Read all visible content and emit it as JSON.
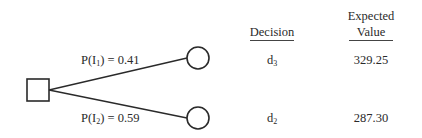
{
  "diagram": {
    "type": "decision-tree",
    "decision_node": {
      "shape": "square"
    },
    "branches": [
      {
        "label_prefix": "P(I",
        "label_sub": "1",
        "label_suffix": ") = 0.41",
        "probability": 0.41,
        "node_shape": "circle",
        "decision_main": "d",
        "decision_sub": "3",
        "expected_value": "329.25"
      },
      {
        "label_prefix": "P(I",
        "label_sub": "2",
        "label_suffix": ") = 0.59",
        "probability": 0.59,
        "node_shape": "circle",
        "decision_main": "d",
        "decision_sub": "2",
        "expected_value": "287.30"
      }
    ],
    "headers": {
      "decision": "Decision",
      "expected_line1": "Expected",
      "expected_line2": "Value"
    },
    "colors": {
      "stroke": "#2a2a2a",
      "background": "#ffffff"
    }
  }
}
